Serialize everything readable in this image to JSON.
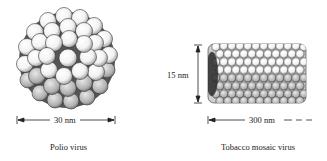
{
  "figure": {
    "left": {
      "name": "polio-virus",
      "caption": "Polio virus",
      "dimension_label": "30 nm",
      "dimension_orientation": "horizontal"
    },
    "right": {
      "name": "tobacco-mosaic-virus",
      "caption": "Tobacco mosaic virus",
      "diameter_label": "15 nm",
      "length_label": "300 nm",
      "length_continues": true
    }
  },
  "colors": {
    "ink": "#222222",
    "background": "#ffffff",
    "shade": "#8a8a8a"
  }
}
